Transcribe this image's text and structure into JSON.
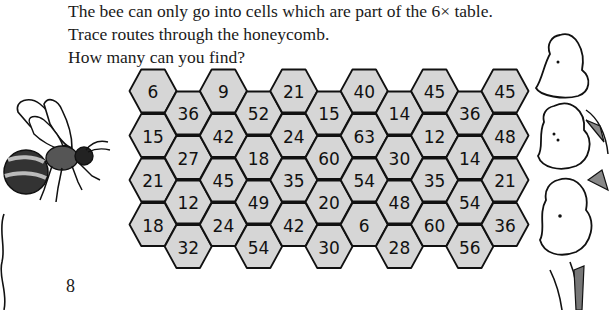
{
  "instructions": {
    "line1": "The bee can only go into cells which are part of the 6×  table.",
    "line2": "Trace routes through the honeycomb.",
    "line3": "How many can you find?"
  },
  "page_number": "8",
  "colors": {
    "hex_fill": "#d6d6d6",
    "hex_stroke": "#111111",
    "text": "#1a1a1a"
  },
  "icons": {
    "bee": "bee-illustration",
    "flower": "foxglove-flower-illustration"
  },
  "honeycomb": {
    "columns": [
      {
        "offset": "high",
        "cells": [
          "6",
          "15",
          "21",
          "18"
        ]
      },
      {
        "offset": "low",
        "cells": [
          "36",
          "27",
          "12",
          "32"
        ]
      },
      {
        "offset": "high",
        "cells": [
          "9",
          "42",
          "45",
          "24"
        ]
      },
      {
        "offset": "low",
        "cells": [
          "52",
          "18",
          "49",
          "54"
        ]
      },
      {
        "offset": "high",
        "cells": [
          "21",
          "24",
          "35",
          "42"
        ]
      },
      {
        "offset": "low",
        "cells": [
          "15",
          "60",
          "20",
          "30"
        ]
      },
      {
        "offset": "high",
        "cells": [
          "40",
          "63",
          "54",
          "6"
        ]
      },
      {
        "offset": "low",
        "cells": [
          "14",
          "30",
          "48",
          "28"
        ]
      },
      {
        "offset": "high",
        "cells": [
          "45",
          "12",
          "35",
          "60"
        ]
      },
      {
        "offset": "low",
        "cells": [
          "36",
          "14",
          "54",
          "56"
        ]
      },
      {
        "offset": "high",
        "cells": [
          "45",
          "48",
          "21",
          "36"
        ]
      }
    ]
  }
}
